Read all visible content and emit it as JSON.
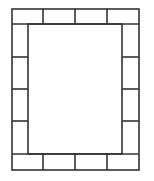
{
  "diagram": {
    "title": "",
    "stroke_color": "#333333",
    "background": "#ffffff",
    "outer": {
      "x": 12,
      "y": 9,
      "w": 127,
      "h": 161
    },
    "inner": {
      "x": 28,
      "y": 24,
      "w": 94,
      "h": 130
    },
    "top_row_tiles": 4,
    "bottom_row_tiles": 4,
    "left_column_tiles": 4,
    "right_column_tiles": 4,
    "horizontal_dividers_x": [
      43,
      75,
      107
    ],
    "vertical_dividers_y": [
      57,
      89,
      121
    ]
  }
}
